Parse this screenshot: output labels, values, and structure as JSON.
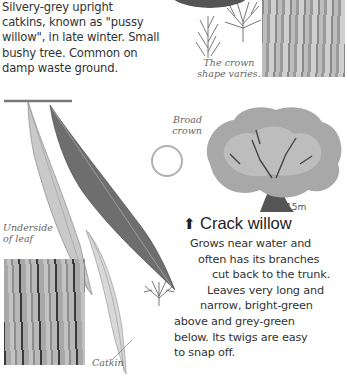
{
  "intro": {
    "lines": [
      "Silvery-grey upright",
      "catkins, known as \"pussy",
      "willow\", in late winter. Small",
      "bushy tree. Common on",
      "damp waste ground."
    ]
  },
  "labels": {
    "crown_shape": [
      "The crown",
      "shape varies."
    ],
    "broad_crown": [
      "Broad",
      "crown"
    ],
    "height": "15m",
    "underside": [
      "Underside",
      "of leaf"
    ],
    "catkin": "Catkin"
  },
  "species": {
    "arrow_icon": "⬆",
    "name": "Crack willow",
    "description_lines": [
      "Grows near water and",
      "often has its branches",
      "cut back to the trunk.",
      "Leaves very long and",
      "narrow, bright-green",
      "above and grey-green",
      "below. Its twigs are easy",
      "to snap off."
    ]
  },
  "colors": {
    "text": "#333333",
    "label": "#666666",
    "circle": "#b0b0b0"
  }
}
